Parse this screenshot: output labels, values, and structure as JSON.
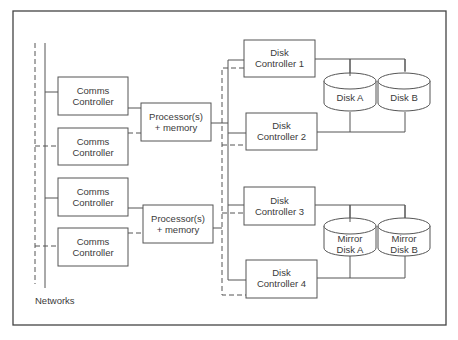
{
  "diagram": {
    "comms_controllers": [
      {
        "line1": "Comms",
        "line2": "Controller"
      },
      {
        "line1": "Comms",
        "line2": "Controller"
      },
      {
        "line1": "Comms",
        "line2": "Controller"
      },
      {
        "line1": "Comms",
        "line2": "Controller"
      }
    ],
    "processors": [
      {
        "line1": "Processor(s)",
        "line2": "+ memory"
      },
      {
        "line1": "Processor(s)",
        "line2": "+ memory"
      }
    ],
    "disk_controllers": [
      {
        "line1": "Disk",
        "line2": "Controller 1"
      },
      {
        "line1": "Disk",
        "line2": "Controller 2"
      },
      {
        "line1": "Disk",
        "line2": "Controller 3"
      },
      {
        "line1": "Disk",
        "line2": "Controller 4"
      }
    ],
    "disks": [
      {
        "line1": "",
        "line2": "Disk A"
      },
      {
        "line1": "",
        "line2": "Disk B"
      },
      {
        "line1": "Mirror",
        "line2": "Disk A"
      },
      {
        "line1": "Mirror",
        "line2": "Disk B"
      }
    ],
    "networks_label": "Networks",
    "colors": {
      "line": "#555555",
      "frame": "#444444",
      "background": "#ffffff"
    }
  }
}
